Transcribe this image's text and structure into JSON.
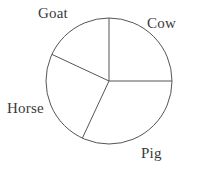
{
  "chart_data": {
    "type": "pie",
    "title": "",
    "subtitle": "",
    "xlabel": "",
    "ylabel": "",
    "grid": false,
    "legend_position": "none",
    "label_placement": "outside",
    "start_angle_deg": 90,
    "direction": "clockwise",
    "center": {
      "x": 109,
      "y": 81
    },
    "radius": 63,
    "categories": [
      "Cow",
      "Pig",
      "Horse",
      "Goat"
    ],
    "values": [
      25,
      32,
      25,
      18
    ],
    "unit": "percent",
    "slices": [
      {
        "label": "Cow",
        "value": 25,
        "start_deg": 0,
        "end_deg": 90,
        "sweep_deg": 90,
        "fill": "none",
        "stroke": "#555555"
      },
      {
        "label": "Pig",
        "value": 32,
        "start_deg": 90,
        "end_deg": 205,
        "sweep_deg": 115,
        "fill": "none",
        "stroke": "#555555"
      },
      {
        "label": "Horse",
        "value": 25,
        "start_deg": 205,
        "end_deg": 295,
        "sweep_deg": 90,
        "fill": "none",
        "stroke": "#555555"
      },
      {
        "label": "Goat",
        "value": 18,
        "start_deg": 295,
        "end_deg": 360,
        "sweep_deg": 65,
        "fill": "none",
        "stroke": "#555555"
      }
    ]
  },
  "figure": {
    "background": "#ffffff",
    "outline_color": "#555555",
    "label_color": "#3a3a3a",
    "labels": {
      "goat": "Goat",
      "cow": "Cow",
      "horse": "Horse",
      "pig": "Pig"
    }
  }
}
